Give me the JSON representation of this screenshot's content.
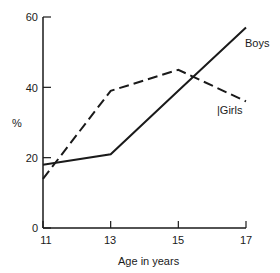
{
  "chart_data": {
    "type": "line",
    "title": "",
    "xlabel": "Age in years",
    "ylabel": "%",
    "x": [
      11,
      13,
      15,
      17
    ],
    "xticks": [
      "11",
      "13",
      "15",
      "17"
    ],
    "yticks": [
      "0",
      "20",
      "40",
      "60"
    ],
    "xlim": [
      11,
      17
    ],
    "ylim": [
      0,
      60
    ],
    "grid": false,
    "legend": "inline labels at line ends",
    "series": [
      {
        "name": "Boys",
        "style": "solid",
        "values": [
          18,
          21,
          39,
          57
        ]
      },
      {
        "name": "Girls",
        "style": "dashed",
        "values": [
          14,
          39,
          45,
          36
        ]
      }
    ],
    "annotations": [
      "Boys",
      "|Girls"
    ]
  },
  "labels": {
    "y_axis": "%",
    "x_axis": "Age in years",
    "boys": "Boys",
    "girls": "|Girls",
    "y0": "0",
    "y20": "20",
    "y40": "40",
    "y60": "60",
    "x11": "11",
    "x13": "13",
    "x15": "15",
    "x17": "17"
  },
  "colors": {
    "line": "#1a1a1a",
    "background": "#ffffff"
  }
}
